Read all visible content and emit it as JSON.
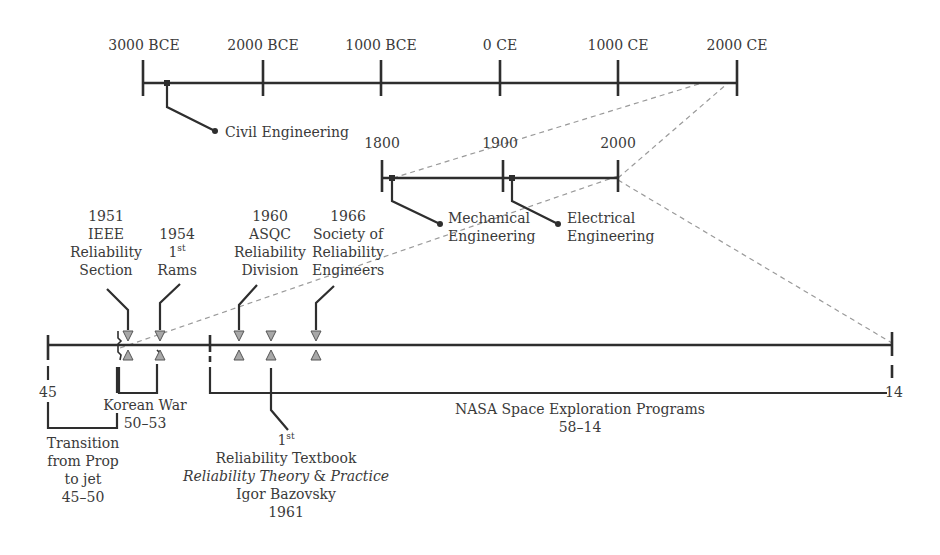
{
  "diagram": {
    "colors": {
      "line": "#2e2e2e",
      "dashed": "#9a9a9a",
      "triangle_fill": "#a8a8a8",
      "text": "#3a3a3a"
    },
    "timeline_ancient": {
      "ticks": [
        "3000 BCE",
        "2000 BCE",
        "1000 BCE",
        "0 CE",
        "1000 CE",
        "2000 CE"
      ],
      "events": [
        {
          "label": "Civil Engineering"
        }
      ]
    },
    "timeline_modern": {
      "ticks": [
        "1800",
        "1900",
        "2000"
      ],
      "events": [
        {
          "label_line1": "Mechanical",
          "label_line2": "Engineering"
        },
        {
          "label_line1": "Electrical",
          "label_line2": "Engineering"
        }
      ]
    },
    "timeline_reliability": {
      "start_label": "45",
      "end_label": "14",
      "top_events": [
        {
          "year": "1951",
          "line2": "IEEE",
          "line3": "Reliability",
          "line4": "Section"
        },
        {
          "year": "1954",
          "line2_main": "1",
          "line2_sup": "st",
          "line3": "Rams"
        },
        {
          "year": "1960",
          "line2": "ASQC",
          "line3": "Reliability",
          "line4": "Division"
        },
        {
          "year": "1966",
          "line2": "Society of",
          "line3": "Reliability",
          "line4": "Engineers"
        }
      ],
      "textbook": {
        "line1_main": "1",
        "line1_sup": "st",
        "line2": "Reliability Textbook",
        "line3_italic_a": "Reliability Theory",
        "line3_amp": " & ",
        "line3_italic_b": "Practice",
        "line4": "Igor Bazovsky",
        "line5": "1961"
      },
      "periods": [
        {
          "name": "Korean War",
          "range": "50–53"
        },
        {
          "name_line1": "Transition",
          "name_line2": "from Prop",
          "name_line3": "to jet",
          "range": "45–50"
        },
        {
          "name": "NASA Space Exploration Programs",
          "range": "58–14"
        }
      ]
    }
  }
}
